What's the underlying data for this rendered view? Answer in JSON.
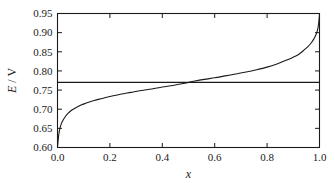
{
  "chart_data": {
    "type": "line",
    "title": "",
    "xlabel": "x",
    "ylabel": "E / V",
    "xlim": [
      0.0,
      1.0
    ],
    "ylim": [
      0.6,
      0.95
    ],
    "grid": false,
    "legend": null,
    "xticks": [
      "0.0",
      "0.2",
      "0.4",
      "0.6",
      "0.8",
      "1.0"
    ],
    "xtick_values": [
      0.0,
      0.2,
      0.4,
      0.6,
      0.8,
      1.0
    ],
    "yticks": [
      "0.60",
      "0.65",
      "0.70",
      "0.75",
      "0.80",
      "0.85",
      "0.90",
      "0.95"
    ],
    "ytick_values": [
      0.6,
      0.65,
      0.7,
      0.75,
      0.8,
      0.85,
      0.9,
      0.95
    ],
    "series": [
      {
        "name": "E vs x (Nernst curve)",
        "style": "solid",
        "x": [
          0.0,
          0.004,
          0.008,
          0.014,
          0.02,
          0.03,
          0.04,
          0.055,
          0.07,
          0.09,
          0.11,
          0.14,
          0.17,
          0.2,
          0.24,
          0.28,
          0.32,
          0.36,
          0.4,
          0.44,
          0.48,
          0.5,
          0.52,
          0.56,
          0.6,
          0.64,
          0.68,
          0.72,
          0.76,
          0.8,
          0.84,
          0.87,
          0.9,
          0.92,
          0.94,
          0.955,
          0.968,
          0.978,
          0.986,
          0.992,
          0.996,
          0.999,
          1.0
        ],
        "y": [
          0.6,
          0.629,
          0.647,
          0.661,
          0.67,
          0.681,
          0.689,
          0.698,
          0.704,
          0.711,
          0.716,
          0.723,
          0.728,
          0.733,
          0.739,
          0.744,
          0.749,
          0.753,
          0.758,
          0.762,
          0.767,
          0.77,
          0.773,
          0.778,
          0.782,
          0.787,
          0.792,
          0.797,
          0.803,
          0.81,
          0.819,
          0.827,
          0.836,
          0.843,
          0.854,
          0.863,
          0.873,
          0.883,
          0.894,
          0.906,
          0.92,
          0.94,
          0.95
        ]
      },
      {
        "name": "reference level",
        "style": "horizontal-line",
        "y_value": 0.77
      }
    ],
    "annotations": []
  },
  "axes": {
    "ylabel_parts": {
      "symbol": "E",
      "separator": " / ",
      "unit": "V"
    },
    "xlabel_symbol": "x"
  },
  "colors": {
    "ink": "#1a1a1a",
    "background": "#ffffff"
  }
}
